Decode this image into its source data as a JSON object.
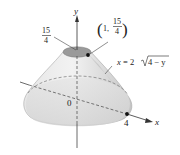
{
  "figure": {
    "axes": {
      "y_label": "y",
      "x_label": "x",
      "origin_label": "0",
      "x_tick_label": "4"
    },
    "top_height_label": {
      "numerator": "15",
      "denominator": "4"
    },
    "point_label": {
      "open": "(",
      "x": "1,",
      "numerator": "15",
      "denominator": "4",
      "close": ")"
    },
    "curve_label": {
      "lhs": "x",
      "eq": "= 2",
      "radicand": "4 − y"
    },
    "colors": {
      "surface_fill": "#d9d9d9",
      "surface_light": "#ececec",
      "cap_fill": "#9a9a9a",
      "axis": "#333333",
      "text": "#222222"
    }
  }
}
